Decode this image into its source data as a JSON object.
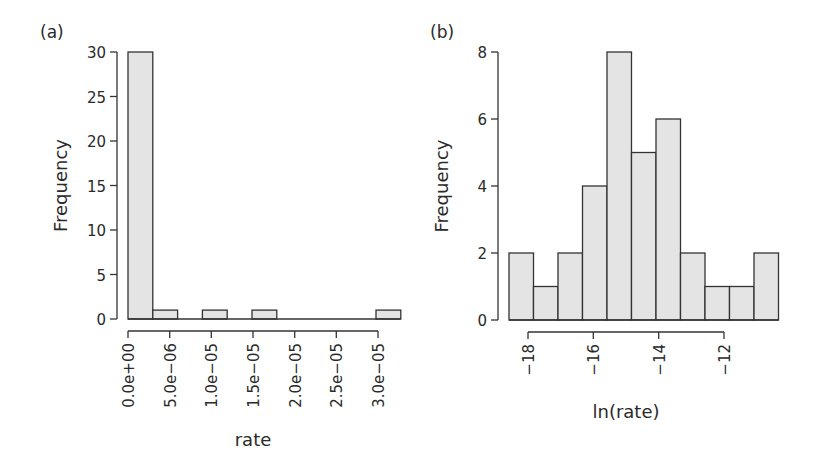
{
  "chart_data": [
    {
      "type": "bar",
      "subtype": "histogram",
      "panel_label": "(a)",
      "xlabel": "rate",
      "ylabel": "Frequency",
      "ylim": [
        0,
        30
      ],
      "yticks": [
        "0",
        "5",
        "10",
        "15",
        "20",
        "25",
        "30"
      ],
      "xticks": [
        "0.0e+00",
        "5.0e−06",
        "1.0e−05",
        "1.5e−05",
        "2.0e−05",
        "2.5e−05",
        "3.0e−05"
      ],
      "bin_width": 3e-06,
      "bins_start": 0,
      "values": [
        30,
        1,
        0,
        1,
        0,
        1,
        0,
        0,
        0,
        0,
        1
      ],
      "grid": false
    },
    {
      "type": "bar",
      "subtype": "histogram",
      "panel_label": "(b)",
      "xlabel": "ln(rate)",
      "ylabel": "Frequency",
      "ylim": [
        0,
        8
      ],
      "yticks": [
        "0",
        "2",
        "4",
        "6",
        "8"
      ],
      "xticks": [
        "−18",
        "−16",
        "−14",
        "−12"
      ],
      "values": [
        2,
        1,
        2,
        4,
        8,
        5,
        6,
        2,
        1,
        1,
        2
      ],
      "grid": false
    }
  ]
}
